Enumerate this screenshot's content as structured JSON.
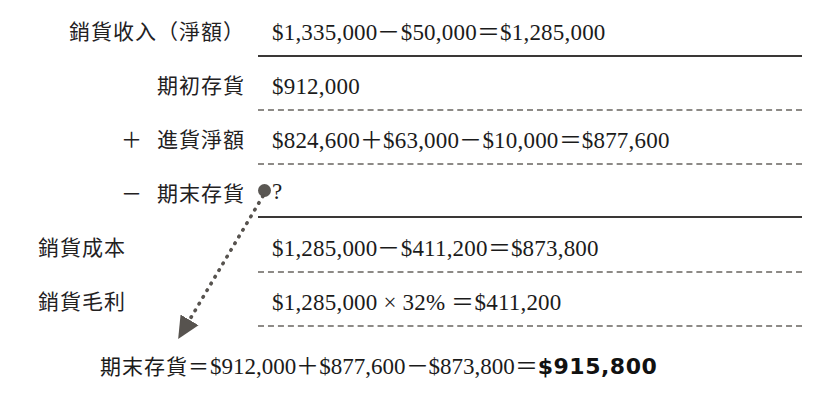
{
  "document": {
    "kind": "cost-of-goods-sold-worksheet",
    "background_color": "#ffffff",
    "ink_color": "#1b1b1b"
  },
  "rows": [
    {
      "label": "銷貨收入（淨額）",
      "operator": "",
      "value": "$1,335,000－$50,000＝$1,285,000",
      "rule_below": "solid"
    },
    {
      "label": "期初存貨",
      "operator": "",
      "value": "$912,000",
      "rule_below": "dashed"
    },
    {
      "label": "進貨淨額",
      "operator": "＋",
      "value": "$824,600＋$63,000－$10,000＝$877,600",
      "rule_below": "dashed"
    },
    {
      "label": "期末存貨",
      "operator": "－",
      "value": "?",
      "rule_below": "solid"
    },
    {
      "label": "銷貨成本",
      "operator": "",
      "value": "$1,285,000－$411,200＝$873,800",
      "rule_below": "dashed"
    },
    {
      "label": "銷貨毛利",
      "operator": "",
      "value": "$1,285,000 × 32%  ＝$411,200",
      "rule_below": "dashed"
    }
  ],
  "summary": {
    "label": "期末存貨",
    "equals": "＝",
    "expression": "$912,000＋$877,600－$873,800＝",
    "answer": "$915,800"
  },
  "annotation": {
    "dot_label": "unknown-value-marker",
    "arrow_label": "answer-pointer-arrow",
    "arrow_style": "dotted",
    "arrow_color": "#5a5753"
  }
}
